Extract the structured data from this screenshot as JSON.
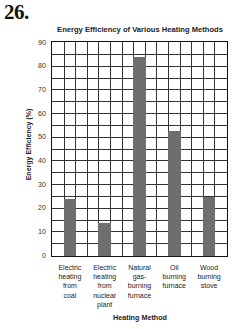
{
  "question_number": "26.",
  "chart_data": {
    "type": "bar",
    "title": "Energy Efficiency of Various Heating Methods",
    "xlabel": "Heating Method",
    "ylabel": "Energy Efficiency (%)",
    "categories": [
      "Electric heating from coal",
      "Electric heating from nuclear plant",
      "Natural gas-burning furnace",
      "Oil burning furnace",
      "Wood burning stove"
    ],
    "category_lines": [
      [
        "Electric",
        "heating",
        "from",
        "coal"
      ],
      [
        "Electric",
        "heating",
        "from",
        "nuclear",
        "plant"
      ],
      [
        "Natural",
        "gas-",
        "burning",
        "furnace"
      ],
      [
        "Oil",
        "burning",
        "furnace"
      ],
      [
        "Wood",
        "burning",
        "stove"
      ]
    ],
    "values": [
      24,
      14,
      84,
      53,
      25
    ],
    "ylim": [
      0,
      90
    ],
    "yticks": [
      "0",
      "10",
      "20",
      "30",
      "40",
      "50",
      "60",
      "70",
      "80",
      "90"
    ],
    "grid": true,
    "grid_minor_step": 5,
    "grid_columns": 15,
    "bar_color": "#6e6e6e",
    "legend": null
  }
}
